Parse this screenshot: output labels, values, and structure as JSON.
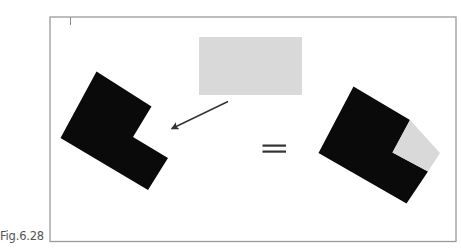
{
  "figure": {
    "caption": "Fig.6.28",
    "frame": {
      "x": 50,
      "y": 17,
      "width": 406,
      "height": 224.5,
      "stroke": "#9a9a9a"
    },
    "tick_mark": {
      "x": 70.5,
      "y1": 17,
      "y2": 25,
      "stroke": "#8a8a8a"
    },
    "colors": {
      "black_shape": "#0a0a0a",
      "gray_square": "#d9d9d9",
      "arrow": "#333333",
      "equals": "#333333"
    },
    "gray_rectangle": {
      "x": 199,
      "y": 37,
      "width": 103,
      "height": 58
    },
    "left_shape": {
      "label": "L-shaped black polygon (square with notch removed)",
      "points": "96.5,71.5 151.5,106.5 133,137 168,158 148,190 60.5,138"
    },
    "arrow": {
      "x1": 228,
      "y1": 101.5,
      "x2": 172,
      "y2": 128.5
    },
    "equals_sign": {
      "x1": 262.5,
      "x2": 286,
      "y_top": 145.5,
      "y_bottom": 151.5
    },
    "right_shape": {
      "label": "Black L-shape with gray square filling the notch",
      "black_points": "353.5,86.5 410,120 392.5,152.5 428,171.5 406.5,203.5 318.5,153",
      "gray_points": "410,120 440,153 428,171.5 392.5,152.5"
    }
  }
}
